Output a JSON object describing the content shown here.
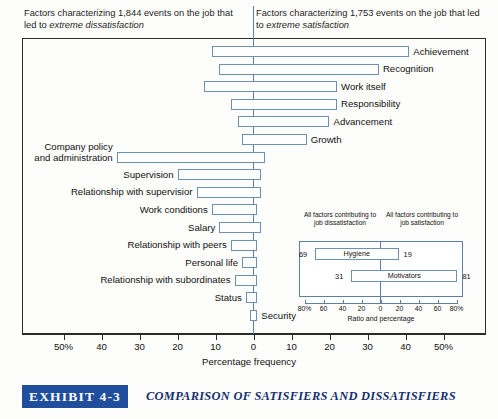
{
  "header": {
    "left_pre": "Factors characterizing 1,844 events on the job that led to ",
    "left_em": "extreme dissatisfaction",
    "right_pre": "Factors characterizing 1,753 events on the job that led to ",
    "right_em": "extreme satisfaction"
  },
  "axis": {
    "title": "Percentage frequency",
    "ticks": [
      "50%",
      "40",
      "30",
      "20",
      "10",
      "0",
      "10",
      "20",
      "30",
      "40",
      "50%"
    ],
    "tick_values": [
      -50,
      -40,
      -30,
      -20,
      -10,
      0,
      10,
      20,
      30,
      40,
      50
    ]
  },
  "inset": {
    "header_left": "All factors contributing to job dissatisfaction",
    "header_right": "All factors contributing to job satisfaction",
    "axis_title": "Ratio and percentage",
    "ticks": [
      "80%",
      "60",
      "40",
      "20",
      "0",
      "20",
      "40",
      "60",
      "80%"
    ],
    "tick_values": [
      -80,
      -60,
      -40,
      -20,
      0,
      20,
      40,
      60,
      80
    ],
    "rows": [
      {
        "label": "Hygiene",
        "left": 69,
        "right": 19
      },
      {
        "label": "Motivators",
        "left": 31,
        "right": 81
      }
    ]
  },
  "caption": {
    "badge": "EXHIBIT 4-3",
    "title": "COMPARISON OF SATISFIERS AND DISSATISFIERS"
  },
  "colors": {
    "bar_stroke": "#6e8fb4",
    "zero_line": "#5b7fa6",
    "frame": "#2b2b2b",
    "badge_bg": "#1f4e9c",
    "caption_text": "#13306e"
  },
  "chart_data": {
    "type": "bar",
    "orientation": "horizontal",
    "title": "Comparison of Satisfiers and Dissatisfiers",
    "xlabel": "Percentage frequency",
    "ylabel": "",
    "xlim": [
      -50,
      50
    ],
    "grid": false,
    "legend": "none",
    "note": "Diverging bars: negative side = percentage of dissatisfaction events, positive side = percentage of satisfaction events.",
    "categories": [
      "Achievement",
      "Recognition",
      "Work itself",
      "Responsibility",
      "Advancement",
      "Growth",
      "Company policy and administration",
      "Supervision",
      "Relationship with supervisior",
      "Work conditions",
      "Salary",
      "Relationship with peers",
      "Personal life",
      "Relationship with subordinates",
      "Status",
      "Security"
    ],
    "series": [
      {
        "name": "Dissatisfaction (%)",
        "values": [
          11,
          9,
          13,
          6,
          4,
          3,
          36,
          20,
          15,
          11,
          9,
          6,
          3,
          5,
          2,
          1
        ]
      },
      {
        "name": "Satisfaction (%)",
        "values": [
          41,
          33,
          22,
          22,
          20,
          14,
          3,
          2,
          2,
          1,
          2,
          1,
          1,
          1,
          1,
          1
        ]
      }
    ]
  }
}
